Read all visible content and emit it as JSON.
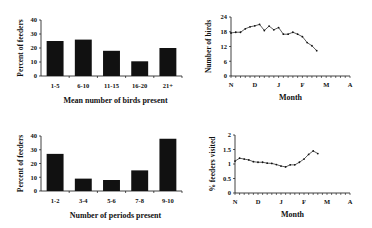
{
  "chart_data": [
    {
      "type": "bar",
      "title": "",
      "xlabel": "Mean number of birds present",
      "ylabel": "Percent of feeders",
      "categories": [
        "1-5",
        "6-10",
        "11-15",
        "16-20",
        "21+"
      ],
      "values": [
        25,
        26,
        18,
        10.5,
        20
      ],
      "ylim": [
        0,
        40
      ],
      "yticks": [
        "0",
        "10",
        "20",
        "30",
        "40"
      ],
      "grid": false,
      "bar_color": "#111111"
    },
    {
      "type": "line",
      "title": "",
      "xlabel": "Month",
      "ylabel": "Number of birds",
      "xticks": [
        "N",
        "D",
        "J",
        "F",
        "M",
        "A"
      ],
      "yticks": [
        "0",
        "6",
        "12",
        "18",
        "24"
      ],
      "ylim": [
        0,
        24
      ],
      "values": [
        17.5,
        17.8,
        17.8,
        19.2,
        20,
        20.4,
        21,
        18.5,
        20.3,
        18.8,
        19.7,
        17,
        17,
        17.8,
        17,
        16,
        13.6,
        12.3,
        10.3
      ],
      "grid": false,
      "line_color": "#333333"
    },
    {
      "type": "bar",
      "title": "",
      "xlabel": "Number of periods present",
      "ylabel": "Percent of feeders",
      "categories": [
        "1-2",
        "3-4",
        "5-6",
        "7-8",
        "9-10"
      ],
      "values": [
        27,
        9,
        8,
        15,
        38
      ],
      "ylim": [
        0,
        40
      ],
      "yticks": [
        "0",
        "10",
        "20",
        "30",
        "40"
      ],
      "grid": false,
      "bar_color": "#111111"
    },
    {
      "type": "line",
      "title": "",
      "xlabel": "Month",
      "ylabel": "% feeders visited",
      "xticks": [
        "N",
        "D",
        "J",
        "F",
        "M",
        "A"
      ],
      "yticks": [
        "0",
        "0.5",
        "1",
        "1.5",
        "2"
      ],
      "ylim": [
        0,
        2
      ],
      "values": [
        1.1,
        1.2,
        1.17,
        1.14,
        1.08,
        1.06,
        1.06,
        1.03,
        1.02,
        0.98,
        0.93,
        0.9,
        0.97,
        0.97,
        1.06,
        1.17,
        1.33,
        1.45,
        1.36
      ],
      "grid": false,
      "line_color": "#333333"
    }
  ]
}
